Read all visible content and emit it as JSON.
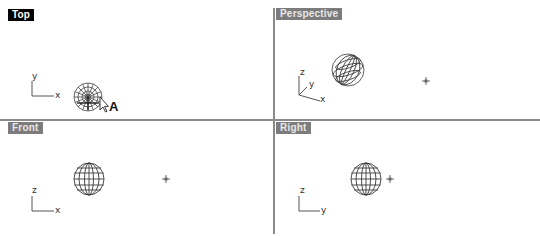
{
  "viewports": [
    {
      "id": "top",
      "label": "Top",
      "active": true,
      "axes": {
        "vertical": "y",
        "horizontal": "x"
      }
    },
    {
      "id": "perspective",
      "label": "Perspective",
      "active": false,
      "axes": {
        "vertical": "z",
        "depth": "y",
        "horizontal": "x"
      }
    },
    {
      "id": "front",
      "label": "Front",
      "active": false,
      "axes": {
        "vertical": "z",
        "horizontal": "x"
      }
    },
    {
      "id": "right",
      "label": "Right",
      "active": false,
      "axes": {
        "vertical": "z",
        "horizontal": "y"
      }
    }
  ],
  "annotations": {
    "cursor_marker": "A"
  },
  "colors": {
    "active_label_bg": "#000000",
    "inactive_label_bg": "#7c7c7c",
    "divider": "#8a8a8a",
    "wire": "#333333"
  }
}
